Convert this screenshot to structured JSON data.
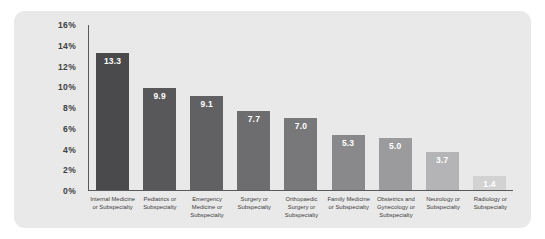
{
  "chart_data": {
    "type": "bar",
    "title": "",
    "xlabel": "",
    "ylabel": "",
    "ylim": [
      0,
      16
    ],
    "grid": false,
    "legend": false,
    "y_ticks": [
      "0%",
      "2%",
      "4%",
      "6%",
      "8%",
      "10%",
      "12%",
      "14%",
      "16%"
    ],
    "y_tick_values": [
      0,
      2,
      4,
      6,
      8,
      10,
      12,
      14,
      16
    ],
    "value_suffix": "%",
    "categories": [
      "Internal Medicine or Subspecialty",
      "Pediatrics or Subspecialty",
      "Emergency Medicine or Subspecialty",
      "Surgery or Subspecialty",
      "Orthopaedic Surgery or Subspecialty",
      "Family Medicine or Subspecialty",
      "Obstetrics and Gynecology or Subspecialty",
      "Neurology or Subspecialty",
      "Radiology or Subspecialty"
    ],
    "values": [
      13.3,
      9.9,
      9.1,
      7.7,
      7.0,
      5.3,
      5.0,
      3.7,
      1.4
    ],
    "value_labels": [
      "13.3",
      "9.9",
      "9.1",
      "7.7",
      "7.0",
      "5.3",
      "5.0",
      "3.7",
      "1.4"
    ],
    "bar_colors": [
      "#4a4a4c",
      "#58585a",
      "#616163",
      "#6d6d6f",
      "#78787a",
      "#89898b",
      "#9b9b9d",
      "#b4b4b6",
      "#d2d2d3"
    ]
  },
  "style": {
    "panel_background": "#e9e9e9",
    "page_background": "#ffffff",
    "axis_color": "#58595b",
    "tick_label_color": "#404040",
    "category_label_color": "#3f3f3f",
    "value_label_color": "#ffffff"
  }
}
